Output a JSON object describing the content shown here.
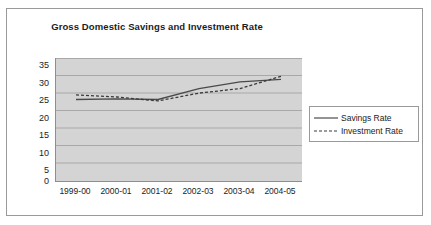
{
  "chart_data": {
    "type": "line",
    "title": "Gross Domestic Savings and Investment Rate",
    "xlabel": "",
    "ylabel": "",
    "categories": [
      "1999-00",
      "2000-01",
      "2001-02",
      "2002-03",
      "2003-04",
      "2004-05"
    ],
    "series": [
      {
        "name": "Savings Rate",
        "style": "solid",
        "color": "#4a4a4a",
        "values": [
          23.2,
          23.4,
          23.2,
          26.3,
          28.2,
          28.9
        ]
      },
      {
        "name": "Investment Rate",
        "style": "dashed",
        "color": "#3a3a3a",
        "values": [
          24.5,
          23.9,
          22.8,
          25.0,
          26.3,
          29.8
        ]
      }
    ],
    "ylim": [
      0,
      35
    ],
    "yticks": [
      0,
      5,
      10,
      15,
      20,
      25,
      30,
      35
    ],
    "ytick_labels": [
      "0",
      "5",
      "10",
      "15",
      "20",
      "25",
      "30",
      "35"
    ],
    "grid": true,
    "gridline_color": "#a8a8a8",
    "plot_background": "#d4d4d4",
    "legend_position": "right"
  },
  "legend": {
    "entries": [
      {
        "label": "Savings Rate"
      },
      {
        "label": "Investment Rate"
      }
    ]
  }
}
